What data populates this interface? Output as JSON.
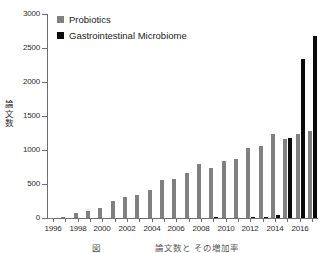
{
  "chart_data": {
    "type": "bar",
    "title": "",
    "xlabel": "(年)",
    "ylabel": "論文数",
    "ylim": [
      0,
      3000
    ],
    "ytick_step": 500,
    "yticks": [
      0,
      500,
      1000,
      1500,
      2000,
      2500,
      3000
    ],
    "grid": false,
    "legend_position": "top-left",
    "categories": [
      "1996",
      "1997",
      "1998",
      "1999",
      "2000",
      "2001",
      "2002",
      "2003",
      "2004",
      "2005",
      "2006",
      "2007",
      "2008",
      "2009",
      "2010",
      "2011",
      "2012",
      "2013",
      "2014",
      "2015",
      "2016",
      "2017"
    ],
    "xtick_labels": [
      "1996",
      "1998",
      "2000",
      "2002",
      "2004",
      "2006",
      "2008",
      "2010",
      "2012",
      "2014",
      "2016"
    ],
    "series": [
      {
        "name": "Probiotics",
        "color": "#808080",
        "values": [
          5,
          8,
          80,
          110,
          140,
          250,
          315,
          345,
          405,
          555,
          575,
          660,
          790,
          730,
          840,
          865,
          1030,
          1060,
          1230,
          1165,
          1230,
          1280
        ]
      },
      {
        "name": "Gastrointestinal Microbiome",
        "color": "#0a0a0a",
        "values": [
          0,
          0,
          0,
          0,
          0,
          0,
          0,
          0,
          0,
          0,
          0,
          0,
          0,
          12,
          0,
          0,
          10,
          20,
          50,
          1170,
          2340,
          2670
        ]
      }
    ]
  },
  "legend": {
    "items": [
      {
        "label": "Probiotics",
        "color": "#808080"
      },
      {
        "label": "Gastrointestinal Microbiome",
        "color": "#0a0a0a"
      }
    ]
  },
  "axes": {
    "y_title_chars": [
      "論",
      "文",
      "数"
    ],
    "x_unit": "（年）"
  },
  "caption": "図　　　　　　論文数と その増加率"
}
